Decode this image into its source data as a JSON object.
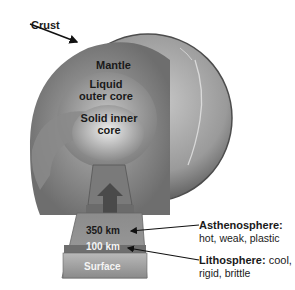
{
  "diagram": {
    "layers": {
      "crust": "Crust",
      "mantle": "Mantle",
      "outer_core_l1": "Liquid",
      "outer_core_l2": "outer core",
      "inner_core_l1": "Solid inner",
      "inner_core_l2": "core"
    },
    "depths": {
      "d350": "350 km",
      "d100": "100 km",
      "surface": "Surface"
    },
    "callouts": {
      "asthenosphere_title": "Asthenosphere:",
      "asthenosphere_desc": "hot, weak, plastic",
      "lithosphere_title": "Lithosphere:",
      "lithosphere_desc1": " cool,",
      "lithosphere_desc2": "rigid, brittle"
    },
    "colors": {
      "background": "#ffffff",
      "text": "#1a1a1a",
      "globe_dark": "#5a5a5a",
      "globe_light": "#bdbdbd",
      "mantle": "#8e8e8e",
      "outer_core": "#a6a6a6",
      "inner_core": "#d2d2d2"
    }
  }
}
